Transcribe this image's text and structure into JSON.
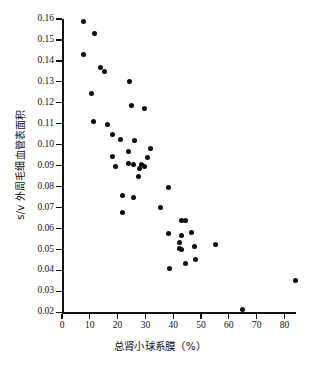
{
  "chart_data": {
    "type": "scatter",
    "title": "",
    "subtitle": "",
    "xlabel": "总肾小球系膜（%）",
    "ylabel": "s/v 外周毛细血管表面积",
    "xlim": [
      0,
      84
    ],
    "ylim": [
      0.02,
      0.16
    ],
    "xticks": [
      0,
      10,
      20,
      30,
      40,
      50,
      60,
      70,
      80
    ],
    "xtick_labels": [
      "0",
      "10",
      "20",
      "30",
      "40",
      "50",
      "60",
      "70",
      "80"
    ],
    "yticks": [
      0.02,
      0.03,
      0.04,
      0.05,
      0.06,
      0.07,
      0.08,
      0.09,
      0.1,
      0.11,
      0.12,
      0.13,
      0.14,
      0.15,
      0.16
    ],
    "ytick_labels": [
      "0.02",
      "0.03",
      "0.04",
      "0.05",
      "0.06",
      "0.07",
      "0.08",
      "0.09",
      "0.10",
      "0.11",
      "0.12",
      "0.13",
      "0.14",
      "0.15",
      "0.16"
    ],
    "grid": false,
    "legend": false,
    "legend_position": "none",
    "marker": "filled-circle",
    "marker_color": "#0d0d0d",
    "marker_size": 5,
    "series": [
      {
        "name": "样本",
        "points": [
          [
            7.8,
            0.159
          ],
          [
            11.8,
            0.153
          ],
          [
            7.8,
            0.143
          ],
          [
            14.0,
            0.137
          ],
          [
            15.3,
            0.135
          ],
          [
            10.6,
            0.1245
          ],
          [
            24.3,
            0.13
          ],
          [
            11.4,
            0.111
          ],
          [
            16.5,
            0.1097
          ],
          [
            25.0,
            0.1185
          ],
          [
            29.5,
            0.1172
          ],
          [
            18.3,
            0.105
          ],
          [
            21.0,
            0.1025
          ],
          [
            26.0,
            0.1022
          ],
          [
            31.9,
            0.098
          ],
          [
            23.9,
            0.0968
          ],
          [
            18.0,
            0.0945
          ],
          [
            30.6,
            0.0938
          ],
          [
            19.2,
            0.0895
          ],
          [
            24.0,
            0.0912
          ],
          [
            25.6,
            0.0908
          ],
          [
            28.6,
            0.0905
          ],
          [
            29.6,
            0.0898
          ],
          [
            27.7,
            0.0888
          ],
          [
            27.6,
            0.0848
          ],
          [
            38.3,
            0.0795
          ],
          [
            21.8,
            0.0756
          ],
          [
            25.8,
            0.0747
          ],
          [
            35.5,
            0.07
          ],
          [
            21.6,
            0.0678
          ],
          [
            43.0,
            0.0637
          ],
          [
            44.3,
            0.0637
          ],
          [
            46.5,
            0.0583
          ],
          [
            38.2,
            0.0578
          ],
          [
            43.0,
            0.0568
          ],
          [
            55.2,
            0.0525
          ],
          [
            42.2,
            0.0533
          ],
          [
            47.5,
            0.0516
          ],
          [
            42.4,
            0.0505
          ],
          [
            43.0,
            0.05
          ],
          [
            47.9,
            0.0453
          ],
          [
            44.5,
            0.0432
          ],
          [
            38.6,
            0.041
          ],
          [
            84.0,
            0.0352
          ],
          [
            65.0,
            0.0212
          ]
        ]
      }
    ]
  }
}
